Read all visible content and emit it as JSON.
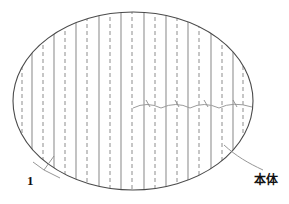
{
  "figure": {
    "type": "patent-line-drawing",
    "background_color": "#ffffff",
    "outline_color": "#4a4a4a",
    "solid_line_color": "#9a9a9a",
    "dashed_line_color": "#8d8d8d",
    "wave_line_color": "#9b9b9b",
    "leader_line_color": "#8a8a8a",
    "ellipse": {
      "center_x": 133,
      "center_y": 101,
      "radius_x": 120,
      "radius_y": 89
    },
    "solid_lines_x": [
      32,
      54,
      76,
      99,
      121,
      144,
      166,
      188,
      211,
      233
    ],
    "dashed_lines_x": [
      22,
      43,
      65,
      87,
      110,
      132,
      155,
      177,
      199,
      222,
      243
    ],
    "wave": {
      "start_x": 133,
      "end_x": 252,
      "y": 108,
      "segments": 4,
      "amplitude": 5
    },
    "wave_ticks_x": [
      146,
      175,
      204,
      233
    ]
  },
  "callouts": [
    {
      "id": "callout-1",
      "label": "1",
      "label_x": 27,
      "label_y": 174,
      "target": "vertical-line-pair-left",
      "leader_from_x": 54,
      "leader_from_y": 157,
      "leader_to_x": 40,
      "leader_to_y": 172
    },
    {
      "id": "callout-honntai",
      "label": "本体",
      "label_x": 254,
      "label_y": 174,
      "target": "ellipse-outline-body",
      "leader_from_x": 228,
      "leader_from_y": 148,
      "leader_to_x": 262,
      "leader_to_y": 171
    }
  ],
  "caption": {
    "text": "",
    "visible": false
  }
}
